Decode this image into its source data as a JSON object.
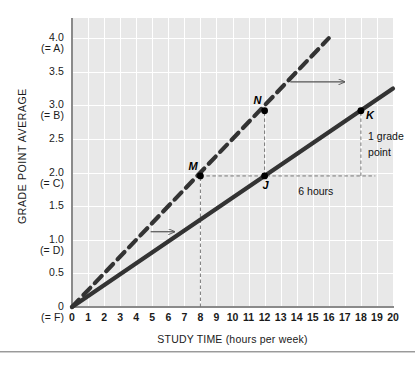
{
  "chart_data": {
    "type": "line",
    "title": "",
    "xlabel": "STUDY TIME (hours per week)",
    "ylabel": "GRADE POINT AVERAGE",
    "xlim": [
      0,
      20
    ],
    "ylim": [
      0,
      4.3
    ],
    "grid": true,
    "legend_position": "none",
    "x_ticks": [
      "0",
      "1",
      "2",
      "3",
      "4",
      "5",
      "6",
      "7",
      "8",
      "9",
      "10",
      "11",
      "12",
      "13",
      "14",
      "15",
      "16",
      "17",
      "18",
      "19",
      "20"
    ],
    "y_ticks": [
      {
        "value": 4.0,
        "label": "4.0",
        "grade": "(= A)"
      },
      {
        "value": 3.5,
        "label": "3.5",
        "grade": ""
      },
      {
        "value": 3.0,
        "label": "3.0",
        "grade": "(= B)"
      },
      {
        "value": 2.5,
        "label": "2.5",
        "grade": ""
      },
      {
        "value": 2.0,
        "label": "2.0",
        "grade": "(= C)"
      },
      {
        "value": 1.5,
        "label": "1.5",
        "grade": ""
      },
      {
        "value": 1.0,
        "label": "1.0",
        "grade": "(= D)"
      },
      {
        "value": 0.5,
        "label": "0.5",
        "grade": ""
      },
      {
        "value": 0.0,
        "label": "0",
        "grade": "(= F)"
      }
    ],
    "series": [
      {
        "name": "original-line",
        "style": "solid",
        "color": "#333333",
        "x": [
          0,
          20
        ],
        "values": [
          0,
          3.25
        ],
        "slope": 0.1625
      },
      {
        "name": "shifted-line",
        "style": "dashed",
        "color": "#333333",
        "x": [
          0,
          16
        ],
        "values": [
          0,
          4.0
        ],
        "slope": 0.25
      }
    ],
    "points": [
      {
        "label": "M",
        "x": 8,
        "y": 1.95,
        "series": "shifted-line"
      },
      {
        "label": "N",
        "x": 12,
        "y": 2.92,
        "series": "shifted-line"
      },
      {
        "label": "J",
        "x": 12,
        "y": 1.95,
        "series": "original-line"
      },
      {
        "label": "K",
        "x": 18,
        "y": 2.92,
        "series": "original-line"
      }
    ],
    "annotations": [
      {
        "name": "six-hours-label",
        "text": "6 hours",
        "x": 14.1,
        "y": 1.72
      },
      {
        "name": "one-grade-point-line1",
        "text": "1 grade",
        "x": 18.45,
        "y": 2.55
      },
      {
        "name": "one-grade-point-line2",
        "text": "point",
        "x": 18.45,
        "y": 2.31
      },
      {
        "name": "shift-arrow-upper",
        "x_start": 13.6,
        "x_end": 17.0,
        "y": 3.35
      },
      {
        "name": "shift-arrow-lower",
        "x_start": 4.9,
        "x_end": 6.4,
        "y": 1.12
      }
    ],
    "guides": [
      {
        "name": "vline-at-8",
        "type": "vertical",
        "x": 8,
        "y_from": 0,
        "y_to": 1.95
      },
      {
        "name": "vline-at-12",
        "type": "vertical",
        "x": 12,
        "y_from": 1.95,
        "y_to": 2.92
      },
      {
        "name": "vline-at-18",
        "type": "vertical",
        "x": 18,
        "y_from": 1.95,
        "y_to": 2.92
      },
      {
        "name": "hline-at-195",
        "type": "horizontal",
        "y": 1.95,
        "x_from": 8,
        "x_to": 18.9
      }
    ]
  }
}
